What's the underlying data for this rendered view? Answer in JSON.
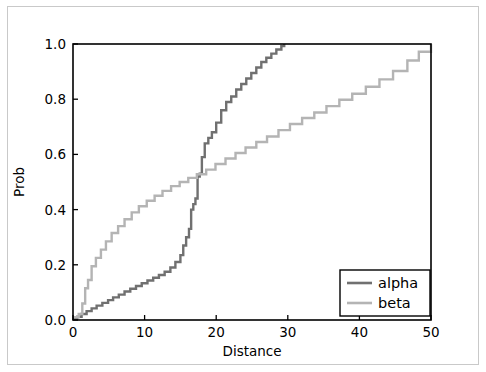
{
  "chart_data": {
    "type": "line",
    "subtype": "step-ecdf",
    "title": "",
    "xlabel": "Distance",
    "ylabel": "Prob",
    "xlim": [
      0,
      50
    ],
    "ylim": [
      0.0,
      1.0
    ],
    "xticks": [
      0,
      10,
      20,
      30,
      40,
      50
    ],
    "xticklabels": [
      "0",
      "10",
      "20",
      "30",
      "40",
      "50"
    ],
    "yticks": [
      0.0,
      0.2,
      0.4,
      0.6,
      0.8,
      1.0
    ],
    "yticklabels": [
      "0.0",
      "0.2",
      "0.4",
      "0.6",
      "0.8",
      "1.0"
    ],
    "grid": false,
    "legend_position": "lower right",
    "legend_entries": [
      "alpha",
      "beta"
    ],
    "series": [
      {
        "name": "alpha",
        "color": "#707070",
        "linewidth": 2.4,
        "drawstyle": "steps-post",
        "x": [
          0.0,
          0.6,
          1.2,
          1.9,
          2.6,
          3.3,
          4.1,
          4.9,
          5.6,
          6.4,
          7.2,
          8.0,
          8.8,
          9.6,
          10.4,
          11.2,
          12.0,
          12.8,
          13.6,
          14.3,
          15.0,
          15.4,
          15.8,
          16.2,
          16.5,
          16.8,
          17.1,
          17.4,
          17.7,
          18.0,
          18.4,
          18.9,
          19.4,
          20.0,
          20.7,
          21.4,
          22.1,
          22.8,
          23.5,
          24.2,
          24.9,
          25.6,
          26.3,
          27.0,
          27.7,
          28.4,
          29.1,
          29.5
        ],
        "y": [
          0.005,
          0.012,
          0.022,
          0.032,
          0.042,
          0.052,
          0.062,
          0.072,
          0.082,
          0.092,
          0.103,
          0.113,
          0.123,
          0.133,
          0.143,
          0.153,
          0.163,
          0.175,
          0.19,
          0.21,
          0.235,
          0.27,
          0.3,
          0.33,
          0.4,
          0.42,
          0.44,
          0.52,
          0.53,
          0.59,
          0.64,
          0.66,
          0.68,
          0.715,
          0.76,
          0.79,
          0.81,
          0.835,
          0.855,
          0.875,
          0.895,
          0.915,
          0.935,
          0.95,
          0.965,
          0.98,
          0.993,
          1.0
        ]
      },
      {
        "name": "beta",
        "color": "#b4b4b4",
        "linewidth": 2.4,
        "drawstyle": "steps-post",
        "x": [
          0.0,
          0.8,
          1.3,
          1.7,
          2.1,
          2.6,
          3.2,
          3.9,
          4.6,
          5.4,
          6.3,
          7.2,
          8.2,
          9.2,
          10.3,
          11.4,
          12.5,
          13.7,
          14.9,
          16.1,
          17.3,
          18.6,
          19.9,
          21.3,
          22.7,
          24.1,
          25.6,
          27.1,
          28.7,
          30.3,
          32.0,
          33.7,
          35.4,
          37.2,
          39.0,
          40.9,
          42.8,
          44.7,
          46.7,
          48.3,
          50.0
        ],
        "y": [
          0.01,
          0.022,
          0.06,
          0.115,
          0.145,
          0.195,
          0.225,
          0.255,
          0.285,
          0.315,
          0.34,
          0.365,
          0.39,
          0.412,
          0.432,
          0.45,
          0.468,
          0.485,
          0.5,
          0.515,
          0.528,
          0.545,
          0.565,
          0.585,
          0.605,
          0.625,
          0.645,
          0.665,
          0.688,
          0.71,
          0.732,
          0.752,
          0.775,
          0.798,
          0.82,
          0.845,
          0.872,
          0.902,
          0.94,
          0.972,
          1.0
        ]
      }
    ]
  },
  "axes": {
    "xlabel": "Distance",
    "ylabel": "Prob"
  },
  "legend": {
    "items": [
      {
        "label": "alpha",
        "color": "#707070"
      },
      {
        "label": "beta",
        "color": "#b4b4b4"
      }
    ]
  },
  "colors": {
    "alpha": "#707070",
    "beta": "#b4b4b4",
    "axis": "#000000",
    "figure_border": "#c9c9c9",
    "background": "#ffffff"
  }
}
